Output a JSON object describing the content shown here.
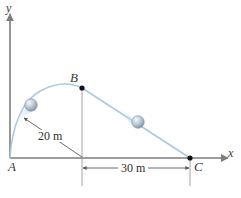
{
  "figure": {
    "background_color": "#ffffff"
  },
  "axes": {
    "x_label": "x",
    "y_label": "y",
    "axis_color": "#7d7d7d",
    "origin_label": "A"
  },
  "points": [
    {
      "id": "A",
      "label": "A",
      "x_px": 10,
      "y_px": 158,
      "marker": "none"
    },
    {
      "id": "B",
      "label": "B",
      "x_px": 82,
      "y_px": 88,
      "marker": "dot"
    },
    {
      "id": "C",
      "label": "C",
      "x_px": 190,
      "y_px": 158,
      "marker": "dot"
    }
  ],
  "paths": {
    "trajectory_color": "#a9c9e2",
    "arc_description": "curved parabolic arc from A to B",
    "line_description": "straight line from B down to C"
  },
  "balls": [
    {
      "id": "ball-on-arc",
      "x_px": 31,
      "y_px": 105,
      "radius_px": 6,
      "has_motion_blur": true
    },
    {
      "id": "ball-on-line",
      "x_px": 138,
      "y_px": 122,
      "radius_px": 6,
      "has_motion_blur": true
    }
  ],
  "dimensions": [
    {
      "id": "dim-20m",
      "label": "20 m",
      "value": 20,
      "unit": "m",
      "orientation": "diagonal",
      "from": "launch point near A on arc",
      "to": "foot of B on x-axis"
    },
    {
      "id": "dim-30m",
      "label": "30 m",
      "value": 30,
      "unit": "m",
      "orientation": "horizontal",
      "from": "foot of B on x-axis",
      "to": "point C"
    }
  ],
  "colors": {
    "axis": "#7d7d7d",
    "trajectory": "#a9c9e2",
    "dimension_line": "#5a5a5a",
    "marker": "#1a1a1a",
    "ball_light": "#e8eef4",
    "ball_mid": "#aab8c4",
    "ball_dark": "#7c8c9c",
    "blur": "#cfe0ee",
    "label_text": "#3a3a3a"
  }
}
